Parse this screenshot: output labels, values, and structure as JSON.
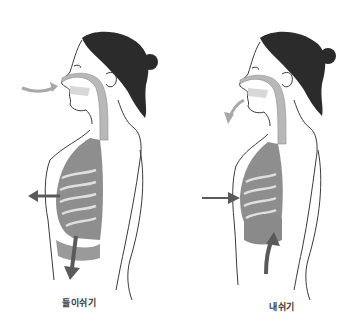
{
  "figures": [
    {
      "id": "inhale",
      "caption": "들이쉬기",
      "arrows": [
        "air-in-nose",
        "chest-out",
        "diaphragm-down"
      ]
    },
    {
      "id": "exhale",
      "caption": "내쉬기",
      "arrows": [
        "air-out-mouth",
        "chest-in",
        "diaphragm-up"
      ]
    }
  ],
  "colors": {
    "hair": "#2b2b2b",
    "airway": "#b8b8b8",
    "lungs": "#6e6e6e",
    "outline": "#3a3a3a",
    "arrow_light": "#a8a8a8",
    "arrow_dark": "#5a5a5a"
  }
}
